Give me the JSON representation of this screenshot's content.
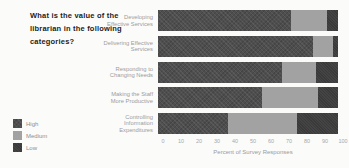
{
  "question": "What is the value of the\nlibrarian in the following\ncategories?",
  "chart_data": {
    "type": "bar",
    "orientation": "horizontal",
    "stacked": true,
    "title": "What is the value of the librarian in the following categories?",
    "categories": [
      "Developing\nEffective Services",
      "Delivering Effective\nServices",
      "Responding to\nChanging Needs",
      "Making the Staff\nMore Productive",
      "Controlling\nInformation\nExpenditures"
    ],
    "series": [
      {
        "name": "High",
        "color": "#4e4e4e",
        "values": [
          74,
          86,
          69,
          58,
          39
        ]
      },
      {
        "name": "Medium",
        "color": "#a2a2a2",
        "values": [
          20,
          11,
          19,
          31,
          38
        ]
      },
      {
        "name": "Low",
        "color": "#3a3a3a",
        "values": [
          6,
          3,
          12,
          11,
          23
        ]
      }
    ],
    "xticks": [
      0,
      10,
      20,
      30,
      40,
      50,
      60,
      70,
      80,
      90,
      100
    ],
    "xlim": [
      0,
      100
    ],
    "xlabel": "Percent of Survey Responses",
    "ylabel": "",
    "grid": false,
    "legend_position": "bottom-left"
  }
}
